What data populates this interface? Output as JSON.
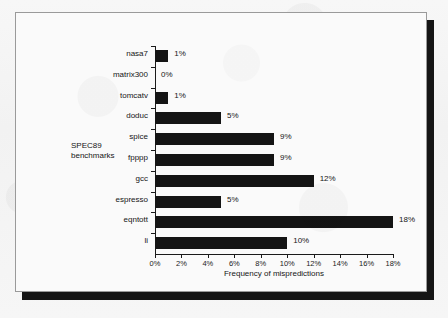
{
  "figure": {
    "background_color": "#fafafa",
    "frame_color": "#9a9a9a",
    "shadow_color": "#151515",
    "bar_color": "#141414",
    "text_color": "#151515"
  },
  "chart_data": {
    "type": "bar",
    "orientation": "horizontal",
    "title": "",
    "xlabel": "Frequency of mispredictions",
    "ylabel": "SPEC89 benchmarks",
    "ylabel_lines": [
      "SPEC89",
      "benchmarks"
    ],
    "categories": [
      "nasa7",
      "matrix300",
      "tomcatv",
      "doduc",
      "spice",
      "fpppp",
      "gcc",
      "espresso",
      "eqntott",
      "li"
    ],
    "values": [
      1,
      0,
      1,
      5,
      9,
      9,
      12,
      5,
      18,
      10
    ],
    "value_labels": [
      "1%",
      "0%",
      "1%",
      "5%",
      "9%",
      "9%",
      "12%",
      "5%",
      "18%",
      "10%"
    ],
    "xlim": [
      0,
      18
    ],
    "xticks": [
      0,
      2,
      4,
      6,
      8,
      10,
      12,
      14,
      16,
      18
    ],
    "xtick_labels": [
      "0%",
      "2%",
      "4%",
      "6%",
      "8%",
      "10%",
      "12%",
      "14%",
      "16%",
      "18%"
    ],
    "grid": false,
    "legend": false
  }
}
